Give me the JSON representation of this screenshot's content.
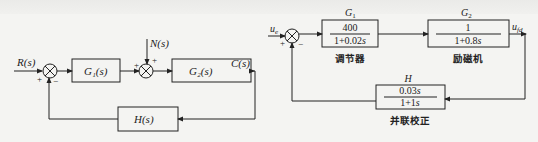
{
  "diagram_left": {
    "input_label": "R(s)",
    "disturbance_label": "N(s)",
    "output_label": "C(s)",
    "blocks": {
      "g1": "G₁(s)",
      "g2": "G₂(s)",
      "h": "H(s)"
    },
    "sum1_signs": {
      "input": "+",
      "feedback": "−"
    },
    "sum2_signs": {
      "input": "+",
      "disturbance": "+"
    }
  },
  "diagram_right": {
    "input_label": "u",
    "input_sub": "e",
    "output_label": "u",
    "output_sub": "fd",
    "sum_signs": {
      "input": "+",
      "feedback": "−"
    },
    "blocks": {
      "g1": {
        "name": "G",
        "sub": "1",
        "numerator": "400",
        "denominator_prefix": "1+0.02",
        "denominator_var": "s",
        "caption": "调节器"
      },
      "g2": {
        "name": "G",
        "sub": "2",
        "numerator": "1",
        "denominator_prefix": "1+0.8",
        "denominator_var": "s",
        "caption": "励磁机"
      },
      "h": {
        "name": "H",
        "numerator_prefix": "0.03",
        "numerator_var": "s",
        "denominator_prefix": "1+1",
        "denominator_var": "s",
        "caption": "并联校正"
      }
    }
  },
  "colors": {
    "line": "#222222",
    "background": "#f4f4f2"
  }
}
